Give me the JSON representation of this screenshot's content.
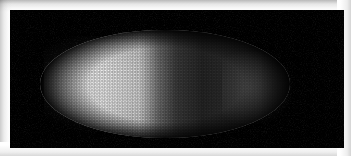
{
  "figure": {
    "domain_label": "Natural-Image",
    "kind": "fluorescence-micrograph",
    "caption": "",
    "title": "",
    "has_text_labels": false,
    "has_scale_bar": false,
    "has_axes": false
  },
  "frame": {
    "mat_color": "#ffffff",
    "shadow_color": "#c8c8c8",
    "mat_thickness_px": 10,
    "panel_background": "#000000",
    "panel_width_px": 334,
    "panel_height_px": 138
  },
  "image": {
    "colorspace": "grayscale",
    "channel_color": "#ffffff",
    "background_color": "#000000",
    "orientation": "anterior-left posterior-right",
    "stage": "syncytial blastoderm / cellularization",
    "width_px": 351,
    "height_px": 156
  },
  "embryo": {
    "shape": "ellipse",
    "center_x_px": 165,
    "center_y_px": 84,
    "length_px": 250,
    "height_px": 108,
    "left_edge_px": 40,
    "right_edge_px": 290,
    "top_edge_px": 30,
    "bottom_edge_px": 138
  },
  "nuclei": {
    "pattern": "hexagonal-monolayer",
    "spacing_px": 3.3,
    "diameter_px": 1.8,
    "peak_color": "#f2f2f2",
    "approx_count": 6000
  },
  "gradient": {
    "name": "anterior-posterior intensity gradient",
    "profile": "exponential-decay",
    "bright_pole": "anterior",
    "dim_pole": "posterior",
    "steepest_dropoff_x_px": 150,
    "relative_intensity_anterior": 1.0,
    "relative_intensity_midpoint": 0.28,
    "relative_intensity_posterior": 0.14
  }
}
